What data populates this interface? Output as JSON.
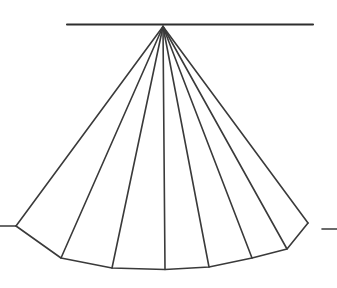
{
  "figure": {
    "title": "",
    "canvas": {
      "width": 337,
      "height": 288,
      "background": "#ffffff"
    },
    "colors": {
      "stroke": "#3a3a3a",
      "stroke_heavy": "#2e2e2e",
      "fill": "#ffffff"
    },
    "stroke_width": 1.6,
    "apex": {
      "x": 163,
      "y": 26.5
    },
    "elements": {
      "horizontal_reference_line": {
        "name": "horizontal-reference-line",
        "x1": 67,
        "y1": 24.5,
        "x2": 313,
        "y2": 24.5
      },
      "right_tick_dash": {
        "name": "right-tick-dash",
        "x1": 322,
        "y1": 229,
        "x2": 337,
        "y2": 229
      },
      "left_tick_dash": {
        "name": "left-tick-dash",
        "x1": 0,
        "y1": 226,
        "x2": 16,
        "y2": 226
      },
      "left_edge": {
        "name": "left-outer-edge",
        "x1": 163,
        "y1": 26.5,
        "x2": 16,
        "y2": 226
      },
      "right_edge": {
        "name": "right-outer-edge",
        "x1": 163,
        "y1": 26.5,
        "x2": 308,
        "y2": 223
      },
      "bottom_arc_points": [
        {
          "x": 16,
          "y": 226
        },
        {
          "x": 61,
          "y": 258
        },
        {
          "x": 112,
          "y": 268
        },
        {
          "x": 165,
          "y": 269.5
        },
        {
          "x": 209,
          "y": 267
        },
        {
          "x": 252,
          "y": 258
        },
        {
          "x": 287,
          "y": 249
        },
        {
          "x": 308,
          "y": 223
        }
      ],
      "ribs": [
        {
          "name": "rib-1",
          "x1": 163,
          "y1": 26.5,
          "x2": 61,
          "y2": 258
        },
        {
          "name": "rib-2",
          "x1": 163,
          "y1": 26.5,
          "x2": 112,
          "y2": 268
        },
        {
          "name": "rib-3",
          "x1": 163,
          "y1": 26.5,
          "x2": 165,
          "y2": 269.5
        },
        {
          "name": "rib-4",
          "x1": 163,
          "y1": 26.5,
          "x2": 209,
          "y2": 267
        },
        {
          "name": "rib-5",
          "x1": 163,
          "y1": 26.5,
          "x2": 252,
          "y2": 258
        },
        {
          "name": "rib-6",
          "x1": 163,
          "y1": 26.5,
          "x2": 287,
          "y2": 249
        }
      ],
      "sector_count": 7
    }
  }
}
